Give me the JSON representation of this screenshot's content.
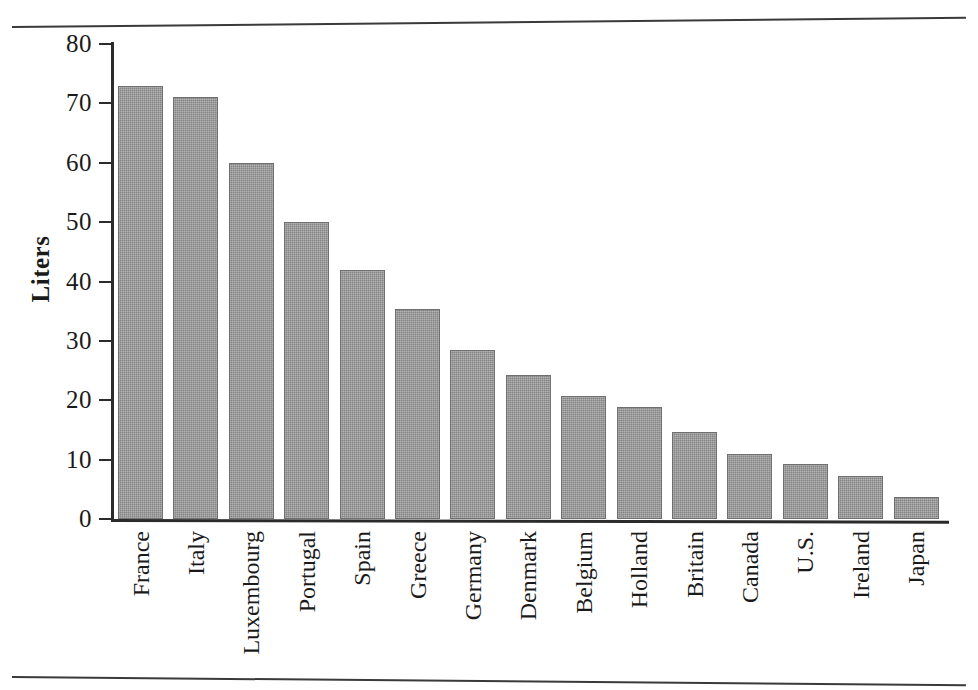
{
  "figure": {
    "background_color": "#ffffff",
    "rule_color": "#3a3a3a",
    "bar_fill_color": "#949494",
    "bar_edge_color": "#6f6f6f",
    "axis_color": "#2b2b2b",
    "text_color": "#1a1a1a"
  },
  "chart_data": {
    "type": "bar",
    "title": "",
    "xlabel": "",
    "ylabel": "Liters",
    "ylim": [
      0,
      80
    ],
    "yticks": [
      0,
      10,
      20,
      30,
      40,
      50,
      60,
      70,
      80
    ],
    "ytick_labels": [
      "0",
      "10",
      "20",
      "30",
      "40",
      "50",
      "60",
      "70",
      "80"
    ],
    "grid": false,
    "legend": null,
    "orientation": "vertical",
    "categories": [
      "France",
      "Italy",
      "Luxembourg",
      "Portugal",
      "Spain",
      "Greece",
      "Germany",
      "Denmark",
      "Belgium",
      "Holland",
      "Britain",
      "Canada",
      "U.S.",
      "Ireland",
      "Japan"
    ],
    "values": [
      73,
      71,
      60,
      50,
      42,
      35.3,
      28.4,
      24.3,
      20.7,
      18.8,
      14.7,
      11,
      9.2,
      7.2,
      3.7
    ],
    "series": [
      {
        "name": "Liters",
        "values": [
          73,
          71,
          60,
          50,
          42,
          35.3,
          28.4,
          24.3,
          20.7,
          18.8,
          14.7,
          11,
          9.2,
          7.2,
          3.7
        ]
      }
    ]
  }
}
